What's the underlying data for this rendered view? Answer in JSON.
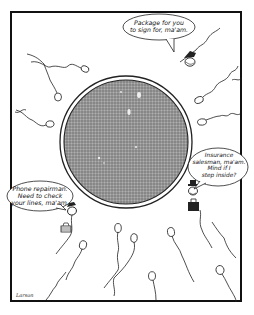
{
  "cartoon": {
    "artist_signature": "Larson",
    "ovum": {
      "fill": "#8c8c8c",
      "outline": "#222222"
    },
    "speech_bubbles": [
      {
        "speaker": "sperm-with-cap-top-right",
        "text": "Package for you\nto sign for, ma'am."
      },
      {
        "speaker": "sperm-with-hat-and-briefcase-right",
        "text": "Insurance\nsalesman, ma'am.\nMind if I\nstep inside?"
      },
      {
        "speaker": "sperm-with-toolbox-left",
        "text": "Phone repairman.\nNeed to check\nyour lines, ma'am."
      }
    ]
  }
}
